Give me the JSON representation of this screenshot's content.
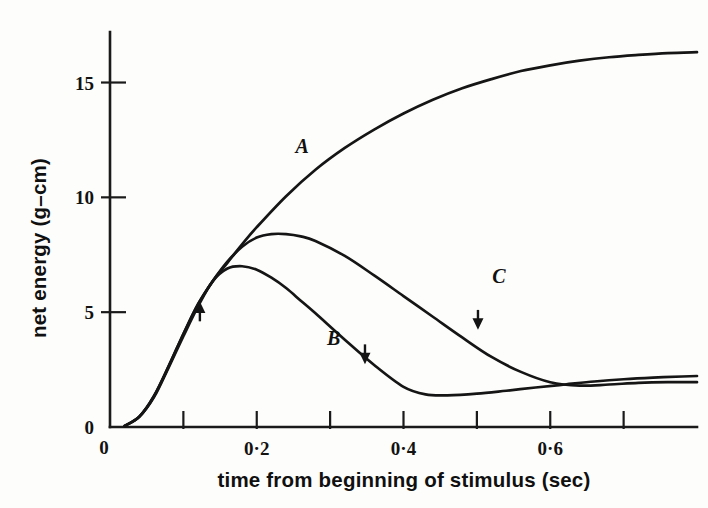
{
  "figure": {
    "background_color": "#fdfdfb",
    "ink_color": "#151515"
  },
  "chart_data": {
    "type": "line",
    "title": "",
    "xlabel": "time from beginning of stimulus (sec)",
    "ylabel": "net energy (g–cm)",
    "xlim": [
      0,
      0.8
    ],
    "ylim": [
      0,
      17.2
    ],
    "grid": false,
    "legend_position": "inline-curve-labels",
    "x_tick_values": [
      0,
      0.1,
      0.2,
      0.3,
      0.4,
      0.5,
      0.6,
      0.7
    ],
    "x_tick_labels": [
      "",
      "",
      "0·2",
      "",
      "0·4",
      "",
      "0·6",
      ""
    ],
    "x_origin_label": "0",
    "y_tick_values": [
      0,
      5,
      10,
      15
    ],
    "y_tick_labels": [
      "0",
      "5",
      "10",
      "15"
    ],
    "series": [
      {
        "name": "A",
        "label": "A",
        "label_x": 0.262,
        "label_y": 11.95,
        "x": [
          0.02,
          0.04,
          0.06,
          0.08,
          0.1,
          0.12,
          0.14,
          0.16,
          0.18,
          0.2,
          0.24,
          0.28,
          0.32,
          0.36,
          0.4,
          0.44,
          0.48,
          0.52,
          0.56,
          0.6,
          0.64,
          0.68,
          0.72,
          0.76,
          0.8
        ],
        "y": [
          0.05,
          0.45,
          1.35,
          2.65,
          4.05,
          5.35,
          6.35,
          7.15,
          7.95,
          8.7,
          10.05,
          11.2,
          12.15,
          12.95,
          13.65,
          14.25,
          14.75,
          15.15,
          15.5,
          15.75,
          15.95,
          16.1,
          16.2,
          16.28,
          16.32
        ]
      },
      {
        "name": "C",
        "label": "C",
        "label_x": 0.53,
        "label_y": 6.25,
        "x": [
          0.02,
          0.04,
          0.06,
          0.08,
          0.1,
          0.12,
          0.14,
          0.16,
          0.18,
          0.2,
          0.22,
          0.24,
          0.26,
          0.28,
          0.32,
          0.36,
          0.4,
          0.44,
          0.48,
          0.52,
          0.56,
          0.6,
          0.64,
          0.68,
          0.72,
          0.76,
          0.8
        ],
        "y": [
          0.05,
          0.45,
          1.35,
          2.65,
          4.05,
          5.35,
          6.35,
          7.2,
          7.85,
          8.25,
          8.4,
          8.4,
          8.3,
          8.1,
          7.45,
          6.6,
          5.7,
          4.8,
          3.9,
          3.05,
          2.4,
          1.95,
          1.8,
          1.85,
          1.92,
          1.95,
          1.95
        ]
      },
      {
        "name": "B",
        "label": "B",
        "label_x": 0.305,
        "label_y": 3.55,
        "x": [
          0.02,
          0.04,
          0.06,
          0.08,
          0.1,
          0.12,
          0.14,
          0.16,
          0.18,
          0.2,
          0.22,
          0.24,
          0.26,
          0.28,
          0.32,
          0.36,
          0.4,
          0.43,
          0.46,
          0.5,
          0.54,
          0.58,
          0.62,
          0.66,
          0.7,
          0.74,
          0.78,
          0.8
        ],
        "y": [
          0.05,
          0.45,
          1.3,
          2.6,
          3.95,
          5.25,
          6.35,
          6.9,
          7.0,
          6.85,
          6.5,
          6.05,
          5.5,
          4.95,
          3.8,
          2.7,
          1.75,
          1.42,
          1.38,
          1.45,
          1.58,
          1.72,
          1.85,
          1.98,
          2.08,
          2.15,
          2.2,
          2.22
        ]
      }
    ],
    "annotations": [
      {
        "name": "arrow-marker-1",
        "direction": "up",
        "x": 0.1225,
        "y": 4.95
      },
      {
        "name": "arrow-marker-2",
        "direction": "down",
        "x": 0.3475,
        "y": 3.25
      },
      {
        "name": "arrow-marker-3",
        "direction": "down",
        "x": 0.5015,
        "y": 4.75
      }
    ]
  }
}
